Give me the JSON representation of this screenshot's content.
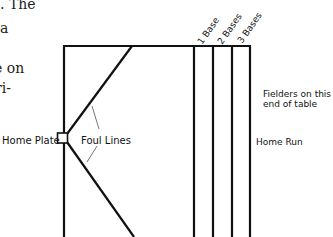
{
  "body_text": {
    "lines": [
      ". The",
      "a",
      "",
      "e on",
      "ri-"
    ]
  },
  "diagram": {
    "home_plate_label": "Home Plate",
    "foul_lines_label": "Foul Lines",
    "zone_labels": [
      "1 Base",
      "2 Bases",
      "3 Bases"
    ],
    "fielders_label_line1": "Fielders on this",
    "fielders_label_line2": "end of table",
    "home_run_label": "Home Run"
  },
  "colors": {
    "line": "#111111",
    "leader": "#666666",
    "background": "#ffffff"
  }
}
